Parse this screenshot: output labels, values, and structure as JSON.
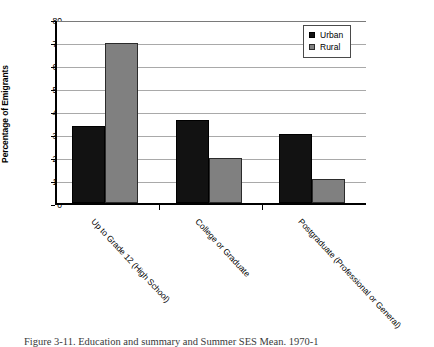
{
  "chart_data": {
    "type": "bar",
    "title": "",
    "xlabel": "",
    "ylabel": "Percentage of Emigrants",
    "ylim": [
      0,
      80
    ],
    "ytick_step": 10,
    "yticks": [
      "0",
      "10",
      "20",
      "30",
      "40",
      "50",
      "60",
      "70",
      "80"
    ],
    "grid": true,
    "legend_position": "top-right",
    "categories": [
      "Up to Grade 12 (High School)",
      "College or Graduate",
      "Postgraduate (Professional or General)"
    ],
    "series": [
      {
        "name": "Urban",
        "color": "#121212",
        "values": [
          33.5,
          36.0,
          30.2
        ]
      },
      {
        "name": "Rural",
        "color": "#808080",
        "values": [
          69.5,
          19.7,
          10.6
        ]
      }
    ]
  },
  "legend": {
    "entries": [
      {
        "label": "Urban",
        "swatch": "urban-swatch-icon"
      },
      {
        "label": "Rural",
        "swatch": "rural-swatch-icon"
      }
    ]
  },
  "caption": {
    "text": "Figure 3-11. Education and summary and Summer SES Mean. 1970-1"
  }
}
